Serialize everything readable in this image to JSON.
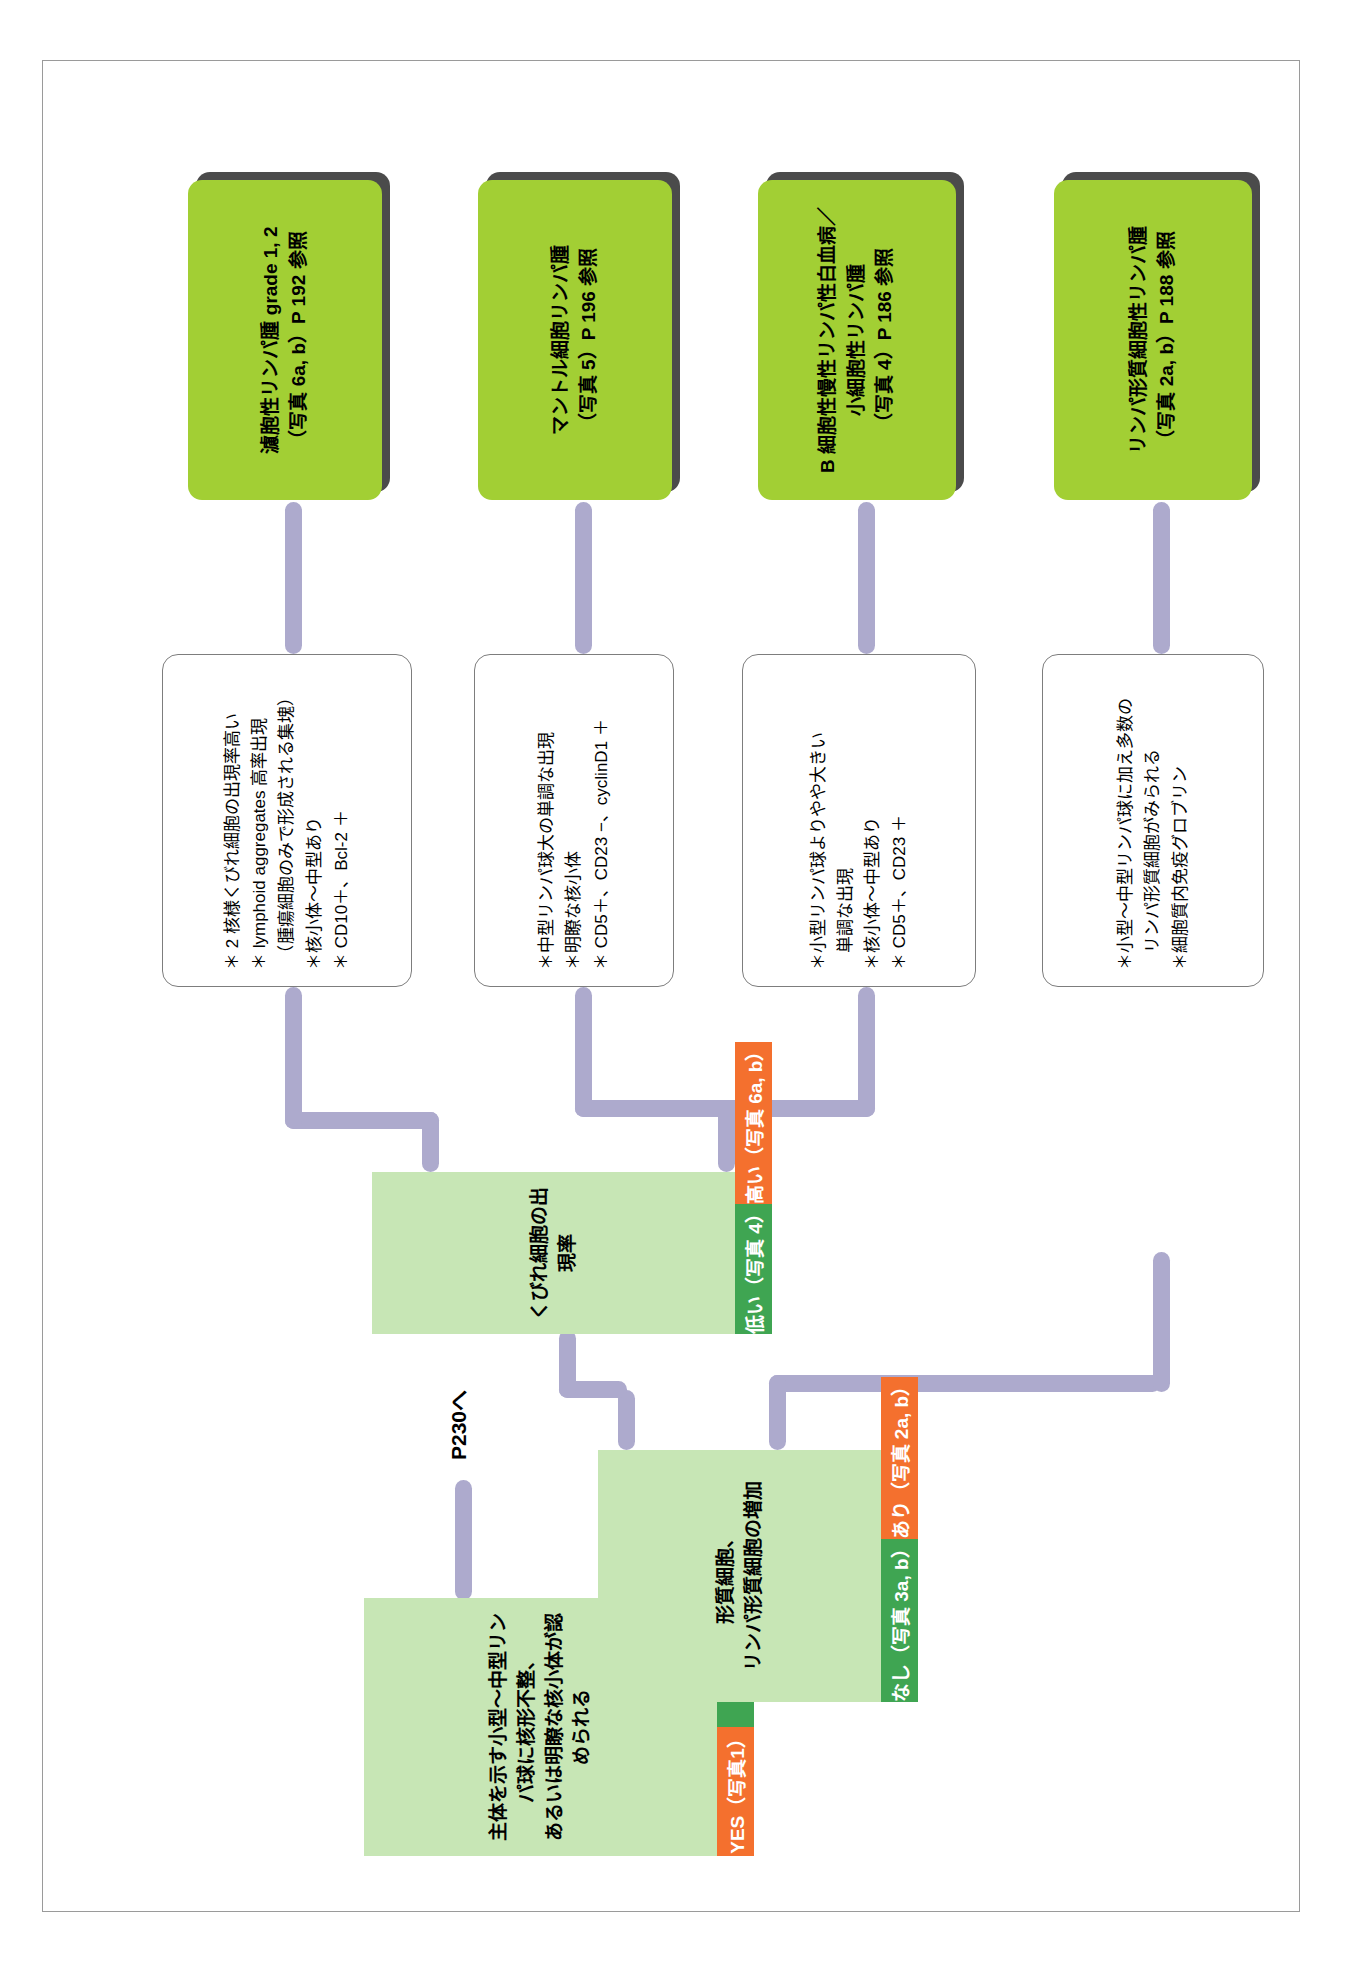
{
  "chart": {
    "orientation": "rotated-90-ccw",
    "colors": {
      "decision_box": "#c7e6b5",
      "yes_bar": "#f4702e",
      "no_bar": "#3fa552",
      "result_box": "#a2cf34",
      "connector": "#adaacd",
      "feature_border": "#7d7d7d",
      "page_border": "#9a9a9a"
    }
  },
  "decisions": [
    {
      "id": "d1",
      "question": "主体を示す小型〜中型リンパ球に核形不整、\nあるいは明瞭な核小体が認められる",
      "yes_label": "YES（写真1）",
      "no_label": "NO"
    },
    {
      "id": "d2",
      "question": "形質細胞、\nリンパ形質細胞の増加",
      "yes_label": "あり（写真 2a, b）",
      "no_label": "なし（写真 3a, b）"
    },
    {
      "id": "d3",
      "question": "くびれ細胞の出現率",
      "yes_label": "高い（写真 6a, b）",
      "no_label": "低い（写真 4）"
    }
  ],
  "exit_label": "P230へ",
  "features": [
    {
      "id": "f1",
      "lines": [
        "＊小型〜中型リンパ球に加え多数の",
        "　リンパ形質細胞がみられる",
        "＊細胞質内免疫グロブリン"
      ]
    },
    {
      "id": "f2",
      "lines": [
        "＊小型リンパ球よりやや大きい",
        "　単調な出現",
        "＊核小体〜中型あり",
        "＊ CD5＋、CD23 ＋"
      ]
    },
    {
      "id": "f3",
      "lines": [
        "＊中型リンパ球大の単調な出現",
        "＊明瞭な核小体",
        "＊ CD5＋、CD23 −、cyclinD1 ＋"
      ]
    },
    {
      "id": "f4",
      "lines": [
        "＊ 2 核様くびれ細胞の出現率高い",
        "＊ lymphoid aggregates 高率出現",
        "　（腫瘍細胞のみで形成される集塊）",
        "＊核小体〜中型あり",
        "＊ CD10＋、Bcl-2 ＋"
      ]
    }
  ],
  "results": [
    {
      "id": "r1",
      "text": "リンパ形質細胞性リンパ腫\n（写真 2a, b）P 188 参照"
    },
    {
      "id": "r2",
      "text": "B 細胞性慢性リンパ性白血病／\n小細胞性リンパ腫\n（写真 4）P 186 参照"
    },
    {
      "id": "r3",
      "text": "マントル細胞リンパ腫\n（写真 5）P 196 参照"
    },
    {
      "id": "r4",
      "text": "濾胞性リンパ腫 grade 1, 2\n（写真 6a, b）P 192 参照"
    }
  ]
}
